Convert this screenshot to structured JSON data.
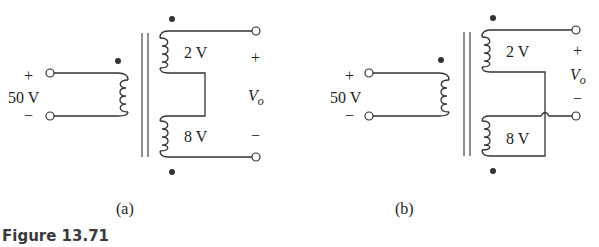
{
  "figure": {
    "caption": "Figure 13.71",
    "panels": [
      {
        "id": "a",
        "label": "(a)",
        "source_plus": "+",
        "source_value": "50 V",
        "source_minus": "−",
        "top_winding": "2 V",
        "bottom_winding": "8 V",
        "out_plus": "+",
        "out_label": "V",
        "out_sub": "o",
        "out_minus": "−"
      },
      {
        "id": "b",
        "label": "(b)",
        "source_plus": "+",
        "source_value": "50 V",
        "source_minus": "−",
        "top_winding": "2 V",
        "bottom_winding": "8 V",
        "out_plus": "+",
        "out_label": "V",
        "out_sub": "o",
        "out_minus": "−"
      }
    ]
  }
}
